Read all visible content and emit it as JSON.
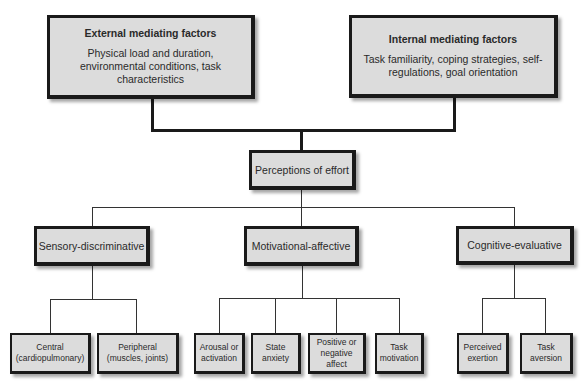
{
  "diagram": {
    "external": {
      "title": "External mediating factors",
      "description": "Physical load and duration, environmental conditions, task characteristics"
    },
    "internal": {
      "title": "Internal mediating factors",
      "description": "Task familiarity, coping strategies, self-regulations, goal orientation"
    },
    "center": {
      "label": "Perceptions of effort"
    },
    "dimensions": [
      {
        "label": "Sensory-discriminative",
        "children": [
          {
            "line1": "Central",
            "line2": "(cardiopulmonary)"
          },
          {
            "line1": "Peripheral",
            "line2": "(muscles, joints)"
          }
        ]
      },
      {
        "label": "Motivational-affective",
        "children": [
          {
            "line1": "Arousal or",
            "line2": "activation"
          },
          {
            "line1": "State",
            "line2": "anxiety"
          },
          {
            "line1": "Positive or",
            "line2": "negative affect"
          },
          {
            "line1": "Task",
            "line2": "motivation"
          }
        ]
      },
      {
        "label": "Cognitive-evaluative",
        "children": [
          {
            "line1": "Perceived",
            "line2": "exertion"
          },
          {
            "line1": "Task",
            "line2": "aversion"
          }
        ]
      }
    ]
  },
  "colors": {
    "box_fill": "#dcdcdc",
    "border": "#1a1a1a",
    "background": "#ffffff"
  }
}
